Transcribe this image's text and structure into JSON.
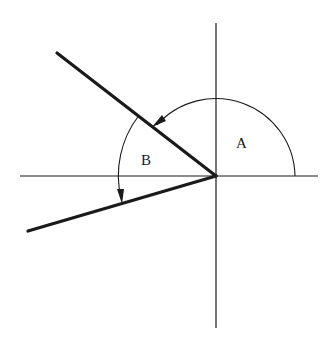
{
  "diagram": {
    "type": "angle-rotation",
    "labels": {
      "a": "A",
      "b": "B"
    },
    "colors": {
      "background": "#ffffff",
      "stroke": "#1a1a1a"
    },
    "elements": [
      {
        "id": "horizontal-axis",
        "kind": "thin-line"
      },
      {
        "id": "vertical-axis",
        "kind": "thin-line"
      },
      {
        "id": "upper-ray",
        "kind": "thick-line",
        "direction": "upper-left"
      },
      {
        "id": "lower-ray",
        "kind": "thick-line",
        "direction": "lower-left"
      },
      {
        "id": "arc-a",
        "kind": "arc-with-arrow",
        "label": "A",
        "from": "positive x-axis",
        "to": "upper-ray"
      },
      {
        "id": "arc-b",
        "kind": "arc-with-arrow",
        "label": "B",
        "from": "upper-ray",
        "to": "lower-ray"
      }
    ]
  }
}
